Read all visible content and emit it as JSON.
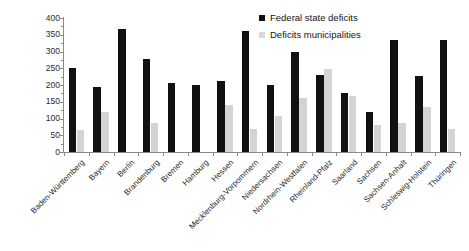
{
  "chart_data": {
    "type": "bar",
    "title": "",
    "subtitle": "",
    "xlabel": "",
    "ylabel": "",
    "ylim": [
      0,
      400
    ],
    "yticks": [
      0,
      50,
      100,
      150,
      200,
      250,
      300,
      350,
      400
    ],
    "grid": false,
    "legend_position": "top-right",
    "categories": [
      "Baden-Württemberg",
      "Bayern",
      "Berlin",
      "Brandenburg",
      "Bremen",
      "Hamburg",
      "Hessen",
      "Mecklenburg-Vorpommern",
      "Niedersachsen",
      "Nordrhein-Westfalen",
      "Rheinland-Pfalz",
      "Saarland",
      "Sachsen",
      "Sachsen-Anhalt",
      "Schleswig-Holstein",
      "Thüringen"
    ],
    "series": [
      {
        "name": "Federal state deficits",
        "color": "#111111",
        "values": [
          250,
          195,
          368,
          278,
          205,
          200,
          212,
          360,
          200,
          298,
          230,
          175,
          118,
          335,
          228,
          335
        ]
      },
      {
        "name": "Deficits municipalities",
        "color": "#d4d4d4",
        "values": [
          65,
          120,
          0,
          88,
          0,
          0,
          140,
          70,
          108,
          160,
          248,
          168,
          82,
          88,
          135,
          68
        ]
      }
    ]
  },
  "legend": {
    "items": [
      {
        "label": "Federal state deficits"
      },
      {
        "label": "Deficits municipalities"
      }
    ]
  }
}
